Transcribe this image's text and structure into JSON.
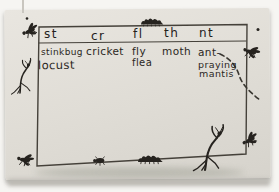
{
  "table": {
    "columns": [
      {
        "header": "st",
        "words": [
          "stinkbug",
          "locust"
        ]
      },
      {
        "header": "cr",
        "words": [
          "cricket"
        ]
      },
      {
        "header": "fl",
        "words": [
          "fly",
          "flea"
        ]
      },
      {
        "header": "th",
        "words": [
          "moth"
        ]
      },
      {
        "header": "nt",
        "words": [
          "ant-",
          "praying",
          "mantis"
        ]
      }
    ]
  },
  "decorations": {
    "top_left": "fly-icon",
    "top_left_speck": "speck-dot",
    "top_center": "caterpillar-icon",
    "top_right_speck": "speck-dot",
    "right_upper": "fly-icon",
    "flight_path": "dashed-flight-path",
    "left_border": "praying-mantis-icon",
    "bottom_left": "fly-icon",
    "bottom_center_left": "beetle-icon",
    "bottom_center_right": "caterpillar-icon",
    "bottom_right": "praying-mantis-icon",
    "right_lower": "fly-icon"
  },
  "colors": {
    "photo_background": "#f6f5f2",
    "paper": "#dfdcd5",
    "frame_line": "#45413a",
    "ink": "#2b2723",
    "insect_silhouette": "#26231f",
    "shadow": "#bcb9b3"
  }
}
